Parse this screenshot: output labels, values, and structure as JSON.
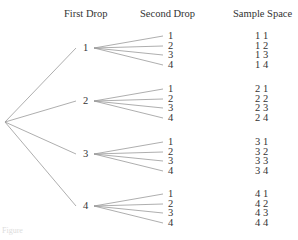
{
  "headers": {
    "first_drop": "First Drop",
    "second_drop": "Second Drop",
    "sample_space": "Sample Space"
  },
  "first_drop": [
    "1",
    "2",
    "3",
    "4"
  ],
  "second_drop": [
    [
      "1",
      "2",
      "3",
      "4"
    ],
    [
      "1",
      "2",
      "3",
      "4"
    ],
    [
      "1",
      "2",
      "3",
      "4"
    ],
    [
      "1",
      "2",
      "3",
      "4"
    ]
  ],
  "sample_space": [
    [
      "1 1",
      "1 2",
      "1 3",
      "1 4"
    ],
    [
      "2 1",
      "2 2",
      "2 3",
      "2 4"
    ],
    [
      "3 1",
      "3 2",
      "3 3",
      "3 4"
    ],
    [
      "4 1",
      "4 2",
      "4 3",
      "4 4"
    ]
  ],
  "caption": "Figure"
}
